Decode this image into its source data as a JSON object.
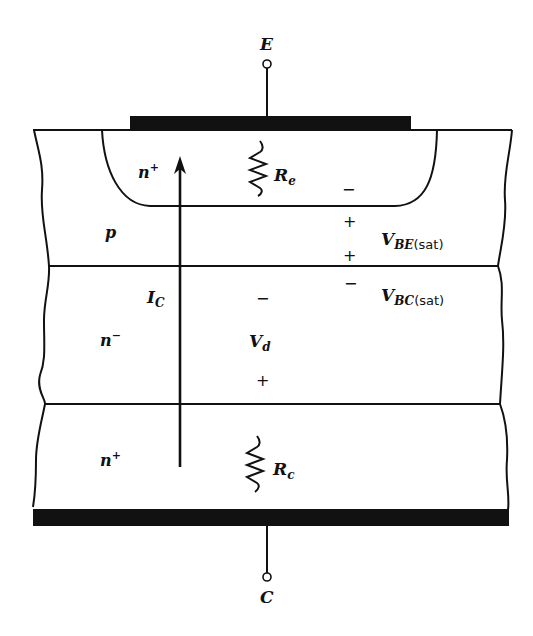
{
  "diagram": {
    "terminals": {
      "emitter": "E",
      "collector": "C"
    },
    "regions": {
      "emitter": {
        "label": "n",
        "sup": "+"
      },
      "base": {
        "label": "p"
      },
      "collector_drift": {
        "label": "n",
        "sup": "−"
      },
      "collector_substrate": {
        "label": "n",
        "sup": "+"
      }
    },
    "resistors": {
      "emitter": {
        "label": "R",
        "sub": "e"
      },
      "collector": {
        "label": "R",
        "sub": "c"
      }
    },
    "current": {
      "label": "I",
      "sub": "C"
    },
    "voltages": {
      "vbe": {
        "label": "V",
        "sub": "BE",
        "suffix": "(sat)"
      },
      "vbc": {
        "label": "V",
        "sub": "BC",
        "suffix": "(sat)"
      },
      "vd": {
        "label": "V",
        "sub": "d"
      }
    },
    "signs": {
      "minus": "−",
      "plus": "+"
    }
  }
}
